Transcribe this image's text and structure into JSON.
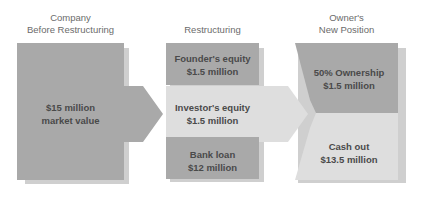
{
  "diagram": {
    "columns": [
      {
        "header_line1": "Company",
        "header_line2": "Before Restructuring"
      },
      {
        "header_line1": "",
        "header_line2": "Restructuring"
      },
      {
        "header_line1": "Owner's",
        "header_line2": "New Position"
      }
    ],
    "before": {
      "line1": "$15 million",
      "line2": "market value"
    },
    "restructuring": [
      {
        "line1": "Founder's equity",
        "line2": "$1.5 million"
      },
      {
        "line1": "Investor's equity",
        "line2": "$1.5 million"
      },
      {
        "line1": "Bank loan",
        "line2": "$12 million"
      }
    ],
    "new_position": [
      {
        "line1": "50% Ownership",
        "line2": "$1.5 million"
      },
      {
        "line1": "Cash out",
        "line2": "$13.5 million"
      }
    ],
    "colors": {
      "dark_box": "#a9a9a9",
      "light_box": "#dedede",
      "shadow": "#c8c8c8",
      "text": "#4a4a4a",
      "header_text": "#6b6b6b"
    }
  }
}
